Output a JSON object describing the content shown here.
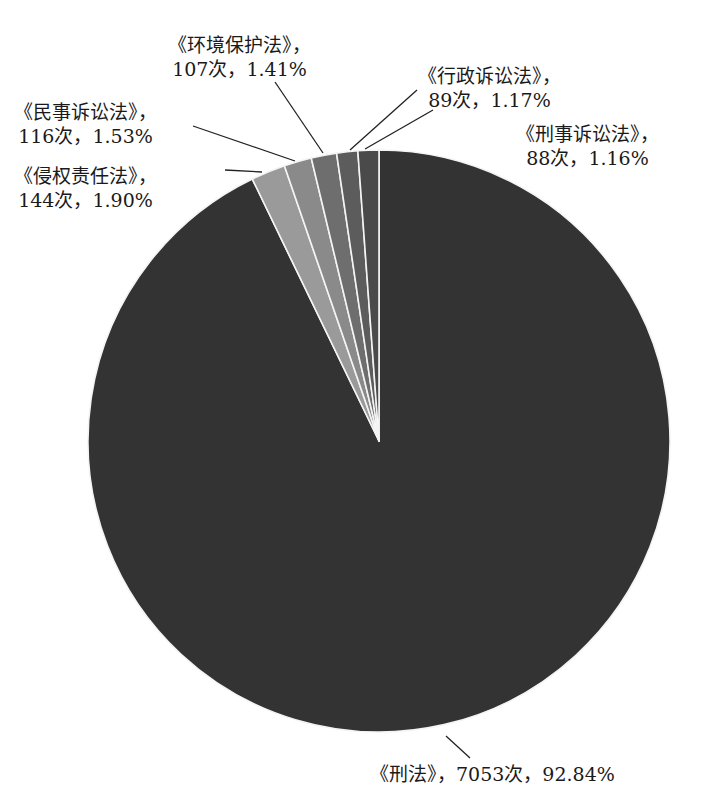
{
  "chart_data": {
    "type": "pie",
    "title": "",
    "start_angle_deg": 0,
    "direction": "clockwise",
    "slices": [
      {
        "name": "《刑法》",
        "count": 7053,
        "percent": 92.84,
        "color": "#333333",
        "label_line1": "《刑法》，7053次，92.84%",
        "label_line2": ""
      },
      {
        "name": "《侵权责任法》",
        "count": 144,
        "percent": 1.9,
        "color": "#9a9a9a",
        "label_line1": "《侵权责任法》，",
        "label_line2": "144次，1.90%"
      },
      {
        "name": "《民事诉讼法》",
        "count": 116,
        "percent": 1.53,
        "color": "#8a8a8a",
        "label_line1": "《民事诉讼法》，",
        "label_line2": "116次，1.53%"
      },
      {
        "name": "《环境保护法》",
        "count": 107,
        "percent": 1.41,
        "color": "#6e6e6e",
        "label_line1": "《环境保护法》，",
        "label_line2": "107次，1.41%"
      },
      {
        "name": "《行政诉讼法》",
        "count": 89,
        "percent": 1.17,
        "color": "#5c5c5c",
        "label_line1": "《行政诉讼法》，",
        "label_line2": "89次，1.17%"
      },
      {
        "name": "《刑事诉讼法》",
        "count": 88,
        "percent": 1.16,
        "color": "#4a4a4a",
        "label_line1": "《刑事诉讼法》，",
        "label_line2": "88次，1.16%"
      }
    ],
    "legend": "none",
    "data_labels": "outside with leader lines"
  }
}
